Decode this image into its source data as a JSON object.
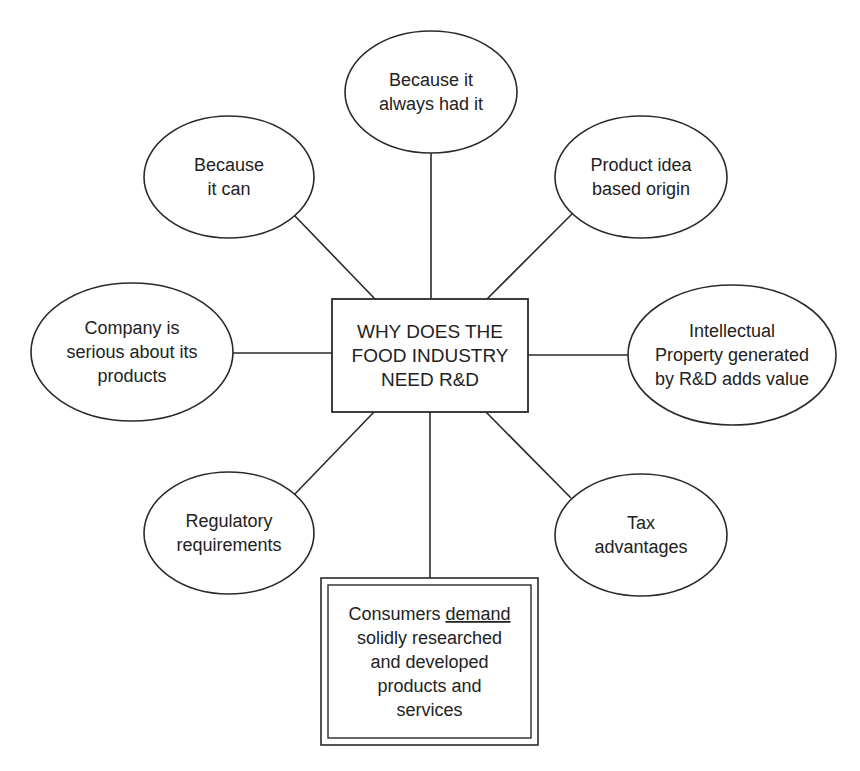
{
  "diagram": {
    "type": "mind-map",
    "style": {
      "stroke": "#2a2a2a",
      "text": "#222222",
      "background": "#ffffff"
    },
    "center": {
      "id": "center",
      "shape": "rect",
      "x": 332,
      "y": 299,
      "w": 196,
      "h": 113,
      "lines": [
        "WHY DOES THE",
        "FOOD INDUSTRY",
        "NEED R&D"
      ]
    },
    "nodes": [
      {
        "id": "always-had-it",
        "shape": "ellipse",
        "cx": 431,
        "cy": 92,
        "rx": 86,
        "ry": 61,
        "lines": [
          "Because it",
          "always had it"
        ]
      },
      {
        "id": "because-it-can",
        "shape": "ellipse",
        "cx": 229,
        "cy": 177,
        "rx": 85,
        "ry": 61,
        "lines": [
          "Because",
          "it can"
        ]
      },
      {
        "id": "product-idea",
        "shape": "ellipse",
        "cx": 641,
        "cy": 177,
        "rx": 86,
        "ry": 61,
        "lines": [
          "Product idea",
          "based origin"
        ]
      },
      {
        "id": "company-serious",
        "shape": "ellipse",
        "cx": 132,
        "cy": 352,
        "rx": 101,
        "ry": 69,
        "lines": [
          "Company is",
          "serious about its",
          "products"
        ]
      },
      {
        "id": "intellectual-property",
        "shape": "ellipse",
        "cx": 732,
        "cy": 355,
        "rx": 104,
        "ry": 70,
        "lines": [
          "Intellectual",
          "Property generated",
          "by R&D adds value"
        ]
      },
      {
        "id": "regulatory",
        "shape": "ellipse",
        "cx": 229,
        "cy": 533,
        "rx": 85,
        "ry": 61,
        "lines": [
          "Regulatory",
          "requirements"
        ]
      },
      {
        "id": "tax",
        "shape": "ellipse",
        "cx": 641,
        "cy": 535,
        "rx": 86,
        "ry": 61,
        "lines": [
          "Tax",
          "advantages"
        ]
      },
      {
        "id": "consumers-demand",
        "shape": "double-rect",
        "x": 321,
        "y": 578,
        "w": 217,
        "h": 167,
        "lines": [
          "Consumers demand",
          "solidly researched",
          "and developed",
          "products and",
          "services"
        ],
        "underlined_word": "demand"
      }
    ],
    "edges": [
      {
        "from": "center",
        "to": "always-had-it",
        "x1": 431,
        "y1": 299,
        "x2": 431,
        "y2": 153
      },
      {
        "from": "center",
        "to": "because-it-can",
        "x1": 375,
        "y1": 299,
        "x2": 294,
        "y2": 215
      },
      {
        "from": "center",
        "to": "product-idea",
        "x1": 487,
        "y1": 299,
        "x2": 573,
        "y2": 213
      },
      {
        "from": "center",
        "to": "company-serious",
        "x1": 332,
        "y1": 353,
        "x2": 233,
        "y2": 353
      },
      {
        "from": "center",
        "to": "intellectual-property",
        "x1": 528,
        "y1": 355,
        "x2": 629,
        "y2": 355
      },
      {
        "from": "center",
        "to": "regulatory",
        "x1": 374,
        "y1": 412,
        "x2": 293,
        "y2": 496
      },
      {
        "from": "center",
        "to": "tax",
        "x1": 486,
        "y1": 412,
        "x2": 571,
        "y2": 498
      },
      {
        "from": "center",
        "to": "consumers-demand",
        "x1": 430,
        "y1": 412,
        "x2": 430,
        "y2": 578
      }
    ]
  }
}
